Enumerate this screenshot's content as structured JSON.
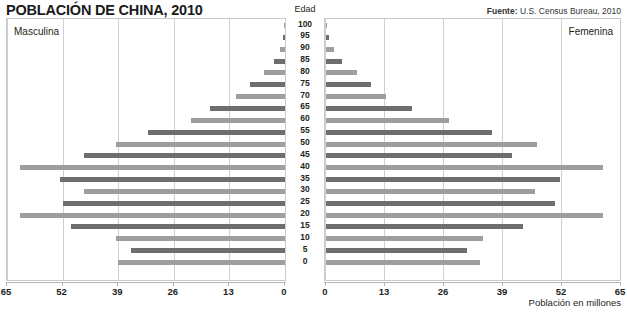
{
  "title": "POBLACIÓN DE CHINA, 2010",
  "source": {
    "prefix": "Fuente:",
    "text": " U.S. Census Bureau, 2010"
  },
  "captions": {
    "male": "Masculina",
    "female": "Femenina",
    "age_header": "Edad"
  },
  "xlabel": "Población en millones",
  "colors": {
    "bar_dark": "#6e6e6e",
    "bar_light": "#9e9e9e",
    "grid": "#d0d0d0",
    "frame": "#c9c9c9"
  },
  "chart_data": {
    "type": "bar",
    "subtype": "population-pyramid",
    "title": "POBLACIÓN DE CHINA, 2010",
    "xlabel": "Población en millones",
    "ylabel": "Edad",
    "xlim_left": [
      65,
      0
    ],
    "xlim_right": [
      0,
      65
    ],
    "grid": true,
    "legend": "none",
    "left_ticks": [
      65,
      52,
      39,
      26,
      13,
      0
    ],
    "right_ticks": [
      0,
      13,
      26,
      39,
      52,
      65
    ],
    "age_groups": [
      100,
      95,
      90,
      85,
      80,
      75,
      70,
      65,
      60,
      55,
      50,
      45,
      40,
      35,
      30,
      25,
      20,
      15,
      10,
      5,
      0
    ],
    "series": [
      {
        "name": "Masculina",
        "side": "left",
        "values": [
          0.1,
          0.4,
          1.1,
          2.5,
          5.0,
          8.2,
          11.5,
          17.5,
          22.0,
          32.0,
          39.5,
          47.0,
          62.0,
          52.5,
          47.0,
          52.0,
          62.0,
          50.0,
          39.5,
          36.0,
          39.0
        ]
      },
      {
        "name": "Femenina",
        "side": "right",
        "values": [
          0.2,
          0.6,
          1.8,
          3.6,
          6.8,
          10.0,
          13.3,
          19.0,
          27.0,
          36.5,
          46.5,
          41.0,
          61.0,
          51.5,
          46.0,
          50.5,
          61.0,
          43.5,
          34.5,
          31.0,
          34.0
        ]
      }
    ]
  }
}
